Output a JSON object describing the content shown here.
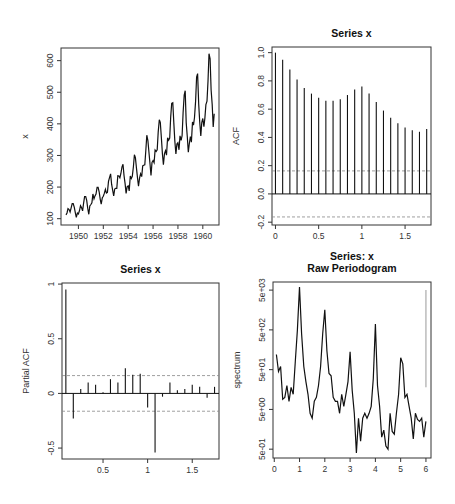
{
  "figure": {
    "panels": [
      "time-series",
      "acf",
      "pacf",
      "periodogram"
    ]
  },
  "chart_data": [
    {
      "panel": "time-series",
      "type": "line",
      "title": "",
      "xlabel": "",
      "ylabel": "x",
      "xlim": [
        1948.6,
        1961.3
      ],
      "ylim": [
        80,
        640
      ],
      "xticks": [
        1950,
        1952,
        1954,
        1956,
        1958,
        1960
      ],
      "yticks": [
        100,
        200,
        300,
        400,
        500,
        600
      ],
      "grid": false,
      "start": 1949,
      "frequency": 12,
      "provenance": "Series identified as the R AirPassengers dataset (monthly 1949-1960) from its shape and labelled peak (~622). Values are the standard published dataset, recalled rather than measured per-point from the pixels; individual months may not match the rendering exactly.",
      "values": [
        112,
        118,
        132,
        129,
        121,
        135,
        148,
        148,
        136,
        119,
        104,
        118,
        115,
        126,
        141,
        135,
        125,
        149,
        170,
        170,
        158,
        133,
        114,
        140,
        145,
        150,
        178,
        163,
        172,
        178,
        199,
        199,
        184,
        162,
        146,
        166,
        171,
        180,
        193,
        181,
        183,
        218,
        230,
        242,
        209,
        191,
        172,
        194,
        196,
        196,
        236,
        235,
        229,
        243,
        264,
        272,
        237,
        211,
        180,
        201,
        204,
        188,
        235,
        227,
        234,
        264,
        302,
        293,
        259,
        229,
        203,
        229,
        242,
        233,
        267,
        269,
        270,
        315,
        364,
        347,
        312,
        274,
        237,
        278,
        284,
        277,
        317,
        313,
        318,
        374,
        413,
        405,
        355,
        306,
        271,
        306,
        315,
        301,
        356,
        348,
        355,
        422,
        465,
        467,
        404,
        347,
        305,
        336,
        340,
        318,
        362,
        348,
        363,
        435,
        491,
        505,
        404,
        359,
        310,
        337,
        360,
        342,
        406,
        396,
        420,
        472,
        548,
        559,
        463,
        407,
        362,
        405,
        417,
        391,
        419,
        461,
        472,
        535,
        622,
        606,
        508,
        461,
        390,
        432
      ]
    },
    {
      "panel": "acf",
      "type": "bar",
      "title": "Series  x",
      "xlabel": "",
      "ylabel": "ACF",
      "xlim": [
        -0.04,
        1.8
      ],
      "ylim": [
        -0.22,
        1.04
      ],
      "xticks": [
        0.0,
        0.5,
        1.0,
        1.5
      ],
      "ytick_labels": [
        "-0.2",
        "0.0",
        "0.2",
        "0.4",
        "0.6",
        "0.8",
        "1.0"
      ],
      "yticks": [
        -0.2,
        0.0,
        0.2,
        0.4,
        0.6,
        0.8,
        1.0
      ],
      "ci": 0.163,
      "provenance": "Bar heights estimated visually from the rendering at roughly gridline precision; approximate.",
      "lags": [
        0.0,
        0.0833,
        0.1667,
        0.25,
        0.3333,
        0.4167,
        0.5,
        0.5833,
        0.6667,
        0.75,
        0.8333,
        0.9167,
        1.0,
        1.0833,
        1.1667,
        1.25,
        1.3333,
        1.4167,
        1.5,
        1.5833,
        1.6667,
        1.75
      ],
      "values": [
        1.0,
        0.95,
        0.88,
        0.81,
        0.75,
        0.71,
        0.68,
        0.66,
        0.66,
        0.67,
        0.7,
        0.74,
        0.76,
        0.71,
        0.65,
        0.59,
        0.54,
        0.5,
        0.47,
        0.45,
        0.44,
        0.46
      ]
    },
    {
      "panel": "pacf",
      "type": "bar",
      "title": "Series  x",
      "xlabel": "",
      "ylabel": "Partial ACF",
      "xlim": [
        0.04,
        1.8
      ],
      "ylim": [
        -0.6,
        1.01
      ],
      "xticks": [
        0.5,
        1.0,
        1.5
      ],
      "yticks": [
        -0.5,
        0.0,
        0.5,
        1.0
      ],
      "ci": 0.163,
      "provenance": "Bar heights and signs estimated visually from the rendering to roughly one decimal; approximate.",
      "lags": [
        0.0833,
        0.1667,
        0.25,
        0.3333,
        0.4167,
        0.5,
        0.5833,
        0.6667,
        0.75,
        0.8333,
        0.9167,
        1.0,
        1.0833,
        1.1667,
        1.25,
        1.3333,
        1.4167,
        1.5,
        1.5833,
        1.6667,
        1.75
      ],
      "values": [
        0.95,
        -0.23,
        0.04,
        0.1,
        0.08,
        0.01,
        0.13,
        0.1,
        0.23,
        0.17,
        0.18,
        -0.13,
        -0.54,
        -0.03,
        0.1,
        0.03,
        0.04,
        0.08,
        0.06,
        -0.04,
        0.06
      ]
    },
    {
      "panel": "periodogram",
      "type": "line",
      "title": "Series: x\nRaw Periodogram",
      "xlabel": "",
      "ylabel": "spectrum",
      "xlim": [
        -0.05,
        6.2
      ],
      "ylim": [
        0.3,
        8000
      ],
      "yscale": "log",
      "xticks": [
        0,
        1,
        2,
        3,
        4,
        5,
        6
      ],
      "yticks": [
        0.5,
        5,
        50,
        500,
        5000
      ],
      "ytick_labels": [
        "5e-01",
        "5e+00",
        "5e+01",
        "5e+02",
        "5e+03"
      ],
      "provenance": "Hand-traced polyline approximating the visible curve shape (peaks near 1,2,3,4,5 on a log scale); not the computed spectrum and not measured point-by-point.",
      "freq": [
        0.083,
        0.167,
        0.25,
        0.333,
        0.417,
        0.5,
        0.583,
        0.667,
        0.75,
        0.833,
        0.917,
        1.0,
        1.083,
        1.167,
        1.25,
        1.333,
        1.417,
        1.5,
        1.583,
        1.667,
        1.75,
        1.833,
        1.917,
        2.0,
        2.083,
        2.167,
        2.25,
        2.333,
        2.417,
        2.5,
        2.583,
        2.667,
        2.75,
        2.833,
        2.917,
        3.0,
        3.083,
        3.167,
        3.25,
        3.333,
        3.417,
        3.5,
        3.583,
        3.667,
        3.75,
        3.833,
        3.917,
        4.0,
        4.083,
        4.167,
        4.25,
        4.333,
        4.417,
        4.5,
        4.583,
        4.667,
        4.75,
        4.833,
        4.917,
        5.0,
        5.083,
        5.167,
        5.25,
        5.333,
        5.417,
        5.5,
        5.583,
        5.667,
        5.75,
        5.833,
        5.917,
        6.0
      ],
      "values": [
        120,
        45,
        60,
        9,
        10,
        20,
        8,
        18,
        12,
        80,
        500,
        6000,
        400,
        60,
        25,
        12,
        4,
        3,
        8,
        10,
        20,
        60,
        400,
        1600,
        150,
        40,
        35,
        10,
        8,
        8,
        4,
        12,
        6,
        12,
        25,
        140,
        15,
        4,
        0.4,
        3,
        0.8,
        3,
        4,
        3,
        4,
        6,
        30,
        700,
        20,
        6,
        1,
        1.5,
        0.6,
        0.5,
        4,
        1.4,
        1.2,
        4,
        12,
        100,
        70,
        10,
        12,
        6,
        3,
        0.9,
        4,
        2.8,
        2.5,
        3,
        1.0,
        2.5
      ]
    }
  ]
}
